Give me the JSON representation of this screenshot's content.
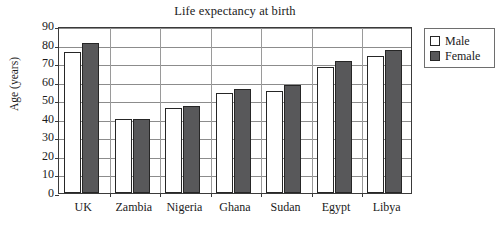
{
  "chart_data": {
    "type": "bar",
    "title": "Life expectancy at birth",
    "xlabel": "",
    "ylabel": "Age (years)",
    "categories": [
      "UK",
      "Zambia",
      "Nigeria",
      "Ghana",
      "Sudan",
      "Egypt",
      "Libya"
    ],
    "series": [
      {
        "name": "Male",
        "values": [
          76,
          40,
          46,
          54,
          55,
          68,
          74
        ]
      },
      {
        "name": "Female",
        "values": [
          81,
          40,
          47,
          56,
          58,
          71,
          77
        ]
      }
    ],
    "ylim": [
      0,
      90
    ],
    "ytick_step": 10,
    "yticks": [
      0,
      10,
      20,
      30,
      40,
      50,
      60,
      70,
      80,
      90
    ],
    "ytick_labels": [
      "0",
      "10",
      "20",
      "30",
      "40",
      "50",
      "60",
      "70",
      "80",
      "90"
    ],
    "grid": true,
    "grid_axis": "y",
    "legend_position": "right-outside",
    "colors": {
      "male": "#ffffff",
      "female": "#58585a",
      "bar_border": "#262626",
      "grid": "#8c8c8c",
      "axis": "#3a3a3a",
      "background": "#ffffff",
      "text": "#1a1a1a"
    }
  },
  "legend": {
    "entries": [
      {
        "label": "Male",
        "swatch": "male"
      },
      {
        "label": "Female",
        "swatch": "female"
      }
    ]
  }
}
